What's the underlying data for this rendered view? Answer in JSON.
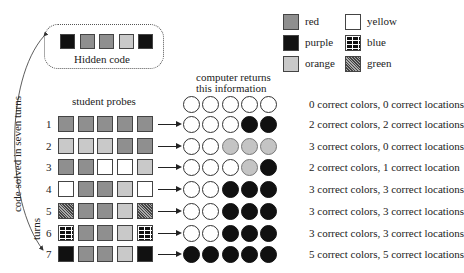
{
  "hidden_code": {
    "label": "Hidden code",
    "colors": [
      "purple",
      "red",
      "red",
      "orange",
      "purple"
    ]
  },
  "legend": [
    {
      "color": "red",
      "label": "red"
    },
    {
      "color": "purple",
      "label": "purple"
    },
    {
      "color": "orange",
      "label": "orange"
    },
    {
      "color": "yellow",
      "label": "yellow"
    },
    {
      "color": "blue",
      "label": "blue"
    },
    {
      "color": "green",
      "label": "green"
    }
  ],
  "side_label": "code solved in seven turns",
  "turns_label": "turns",
  "probes_header": "student probes",
  "feedback_header_line1": "computer returns",
  "feedback_header_line2": "this information",
  "header_feedback": {
    "pegs": [
      "white",
      "white",
      "white",
      "white",
      "white"
    ],
    "text": "0 correct colors, 0 correct locations"
  },
  "turns": [
    {
      "n": "1",
      "probe": [
        "red",
        "red",
        "red",
        "red",
        "red"
      ],
      "pegs": [
        "white",
        "white",
        "white",
        "black",
        "black"
      ],
      "text": "2 correct colors, 2 correct locations"
    },
    {
      "n": "2",
      "probe": [
        "orange",
        "orange",
        "orange",
        "red",
        "red"
      ],
      "pegs": [
        "white",
        "white",
        "gray",
        "gray",
        "gray"
      ],
      "text": "3 correct colors, 0 correct locations"
    },
    {
      "n": "3",
      "probe": [
        "red",
        "red",
        "yellow",
        "yellow",
        "orange"
      ],
      "pegs": [
        "white",
        "white",
        "white",
        "gray",
        "black"
      ],
      "text": "2 correct colors, 1 correct location"
    },
    {
      "n": "4",
      "probe": [
        "yellow",
        "red",
        "red",
        "orange",
        "yellow"
      ],
      "pegs": [
        "white",
        "white",
        "black",
        "black",
        "black"
      ],
      "text": "3 correct colors, 3 correct locations"
    },
    {
      "n": "5",
      "probe": [
        "green",
        "red",
        "red",
        "orange",
        "green"
      ],
      "pegs": [
        "white",
        "white",
        "black",
        "black",
        "black"
      ],
      "text": "3 correct colors, 3 correct locations"
    },
    {
      "n": "6",
      "probe": [
        "blue",
        "red",
        "red",
        "orange",
        "blue"
      ],
      "pegs": [
        "white",
        "white",
        "black",
        "black",
        "black"
      ],
      "text": "3 correct colors, 3 correct locations"
    },
    {
      "n": "7",
      "probe": [
        "purple",
        "red",
        "red",
        "orange",
        "purple"
      ],
      "pegs": [
        "black",
        "black",
        "black",
        "black",
        "black"
      ],
      "text": "5 correct colors, 5 correct locations"
    }
  ]
}
